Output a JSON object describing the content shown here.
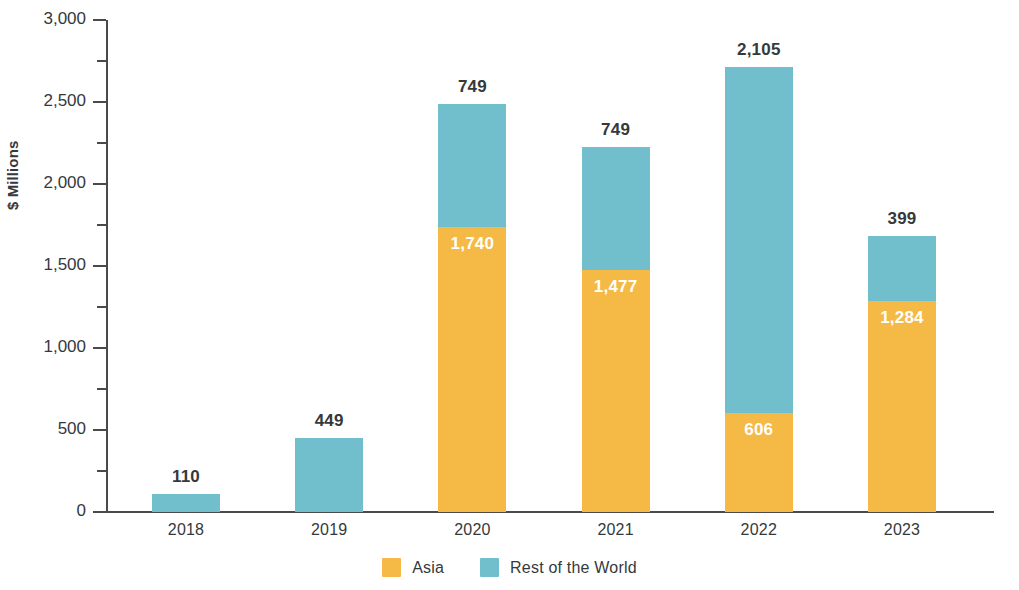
{
  "chart_data": {
    "type": "bar",
    "subtype": "stacked-bar",
    "title": "",
    "subtitle": "",
    "xlabel": "",
    "ylabel": "$ Millions",
    "categories": [
      "2018",
      "2019",
      "2020",
      "2021",
      "2022",
      "2023"
    ],
    "series": [
      {
        "name": "Asia",
        "color": "#f5b945",
        "values": [
          0,
          0,
          1740,
          1477,
          606,
          1284
        ],
        "labels": [
          "",
          "",
          "1,740",
          "1,477",
          "606",
          "1,284"
        ]
      },
      {
        "name": "Rest of the World",
        "color": "#71becd",
        "values": [
          110,
          449,
          749,
          749,
          2105,
          399
        ],
        "labels": [
          "110",
          "449",
          "749",
          "749",
          "2,105",
          "399"
        ]
      }
    ],
    "totals": [
      110,
      449,
      2489,
      2226,
      2711,
      1683
    ],
    "ylim": [
      0,
      3000
    ],
    "ytick_values": [
      0,
      500,
      1000,
      1500,
      2000,
      2500,
      3000
    ],
    "ytick_labels": [
      "0",
      "500",
      "1,000",
      "1,500",
      "2,000",
      "2,500",
      "3,000"
    ],
    "yminor_values": [
      250,
      750,
      1250,
      1750,
      2250,
      2750
    ],
    "grid": false,
    "legend_position": "bottom-center",
    "stack_order": [
      "Asia",
      "Rest of the World"
    ],
    "top_label_series": "Rest of the World"
  },
  "axis": {
    "y_title": "$ Millions"
  },
  "legend": {
    "items": [
      {
        "label": "Asia",
        "color": "#f5b945"
      },
      {
        "label": "Rest of the World",
        "color": "#71becd"
      }
    ]
  }
}
